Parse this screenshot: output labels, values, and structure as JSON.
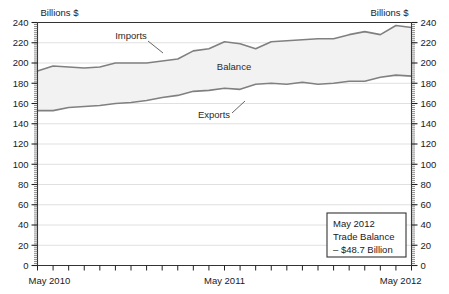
{
  "chart_data": {
    "type": "area",
    "title": "",
    "subtitle": "",
    "xlabel": "",
    "ylabel": "Billions $",
    "ylabel_right": "Billions $",
    "ylim": [
      0,
      240
    ],
    "ytick_step": 20,
    "yticks": [
      0,
      20,
      40,
      60,
      80,
      100,
      120,
      140,
      160,
      180,
      200,
      220,
      240
    ],
    "ytick_labels": [
      "0",
      "20",
      "40",
      "60",
      "80",
      "100",
      "120",
      "140",
      "160",
      "180",
      "200",
      "220",
      "240"
    ],
    "grid": true,
    "grid_axis": "y",
    "minor_ticks": true,
    "legend": "inline-annotations",
    "x": [
      "May 2010",
      "Jun 2010",
      "Jul 2010",
      "Aug 2010",
      "Sep 2010",
      "Oct 2010",
      "Nov 2010",
      "Dec 2010",
      "Jan 2011",
      "Feb 2011",
      "Mar 2011",
      "Apr 2011",
      "May 2011",
      "Jun 2011",
      "Jul 2011",
      "Aug 2011",
      "Sep 2011",
      "Oct 2011",
      "Nov 2011",
      "Dec 2011",
      "Jan 2012",
      "Feb 2012",
      "Mar 2012",
      "Apr 2012",
      "May 2012"
    ],
    "xtick_labels": [
      "May 2010",
      "May 2011",
      "May 2012"
    ],
    "xtick_label_positions": [
      0,
      12,
      24
    ],
    "series": [
      {
        "name": "Imports",
        "color": "#808080",
        "values": [
          192,
          197,
          196,
          195,
          196,
          200,
          200,
          200,
          202,
          204,
          212,
          214,
          221,
          219,
          214,
          221,
          222,
          223,
          224,
          224,
          228,
          231,
          228,
          237,
          235
        ]
      },
      {
        "name": "Exports",
        "color": "#808080",
        "values": [
          153,
          153,
          156,
          157,
          158,
          160,
          161,
          163,
          166,
          168,
          172,
          173,
          175,
          174,
          179,
          180,
          179,
          181,
          179,
          180,
          182,
          182,
          186,
          188,
          187
        ]
      }
    ],
    "area_between": {
      "name": "Balance",
      "fill": "#f2f2f2"
    },
    "annotations": [
      {
        "name": "Imports",
        "text": "Imports",
        "kind": "series-label"
      },
      {
        "name": "Exports",
        "text": "Exports",
        "kind": "series-label"
      },
      {
        "name": "Balance",
        "text": "Balance",
        "kind": "area-label"
      }
    ],
    "callout_box": {
      "line1": "May 2012",
      "line2": "Trade Balance",
      "line3": "– $48.7 Billion"
    }
  },
  "axis": {
    "left_unit": "Billions $",
    "right_unit": "Billions $"
  }
}
